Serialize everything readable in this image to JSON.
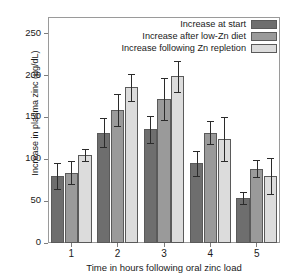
{
  "chart_data": {
    "type": "bar",
    "title": "",
    "xlabel": "Time in hours following oral zinc load",
    "ylabel": "Increase in plasma zinc (µg/dL)",
    "categories": [
      "1",
      "2",
      "3",
      "4",
      "5"
    ],
    "ylim": [
      0,
      270
    ],
    "yticks": [
      0,
      50,
      100,
      150,
      200,
      250
    ],
    "ytick_labels": [
      "0",
      "50",
      "100",
      "150",
      "200",
      "250"
    ],
    "grid": false,
    "legend_position": "top-right",
    "error_bars": "symmetric",
    "series": [
      {
        "name": "Increase at start",
        "color": "#6e6e6e",
        "values": [
          80,
          132,
          136,
          95,
          54
        ],
        "errors": [
          15,
          17,
          16,
          15,
          7
        ]
      },
      {
        "name": "Increase after low-Zn diet",
        "color": "#9a9a9a",
        "values": [
          84,
          159,
          172,
          132,
          89
        ],
        "errors": [
          14,
          19,
          25,
          14,
          10
        ]
      },
      {
        "name": "Increase following Zn repletion",
        "color": "#dcdcdc",
        "values": [
          105,
          186,
          199,
          124,
          80
        ],
        "errors": [
          7,
          16,
          19,
          26,
          21
        ]
      }
    ]
  },
  "axis": {
    "frame_color": "#9a9a9a",
    "tick_color": "#7d7d7d"
  }
}
